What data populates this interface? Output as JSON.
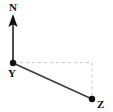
{
  "figure": {
    "type": "bearing-diagram",
    "background_color": "#ffffff",
    "width": 113,
    "height": 112
  },
  "labels": {
    "north": "N",
    "station_y": "Y",
    "station_z": "Z"
  },
  "colors": {
    "line": "#3a3a3a",
    "point": "#111111",
    "dashed": "#c8c8c8",
    "text": "#111111"
  },
  "geometry": {
    "north_arrow": {
      "tip_x": 13,
      "tip_y": 15,
      "base_x": 13,
      "base_y": 63
    },
    "point_y": {
      "x": 13,
      "y": 63,
      "radius": 3.2
    },
    "point_z": {
      "x": 92,
      "y": 99,
      "radius": 3.2
    },
    "corner": {
      "x": 92,
      "y": 63
    },
    "label_positions": {
      "north": {
        "x": 13,
        "y": 11
      },
      "station_y": {
        "x": 12,
        "y": 76
      },
      "station_z": {
        "x": 98,
        "y": 107
      }
    }
  }
}
